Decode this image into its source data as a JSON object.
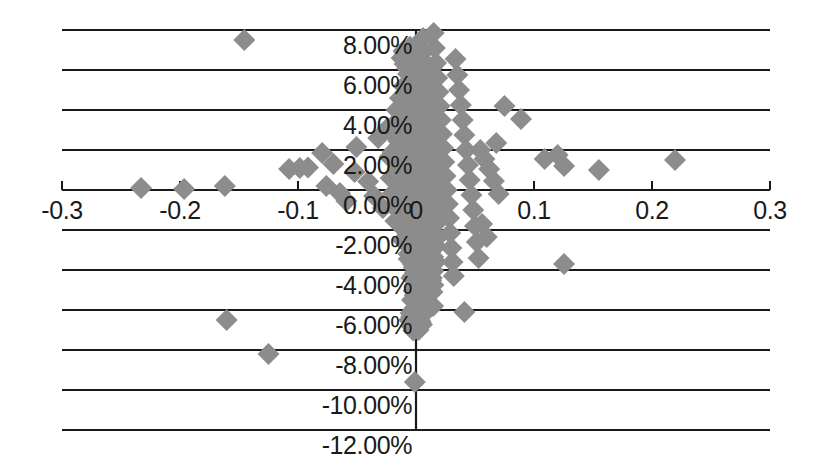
{
  "chart_data": {
    "type": "scatter",
    "title": "",
    "subtitle": "",
    "xlabel": "",
    "ylabel": "",
    "xlim": [
      -0.3,
      0.3
    ],
    "ylim": [
      -0.12,
      0.08
    ],
    "grid": true,
    "grid_axis": "y",
    "legend": null,
    "legend_position": "none",
    "marker": {
      "shape": "diamond",
      "color": "#8c8c8c",
      "size_px": 22,
      "edge": "none"
    },
    "axis_color": "#1a1a1a",
    "background_color": "#ffffff",
    "x_ticks": [
      -0.3,
      -0.2,
      -0.1,
      0,
      0.1,
      0.2,
      0.3
    ],
    "x_tick_labels": [
      "-0.3",
      "-0.2",
      "-0.1",
      "0",
      "0.1",
      "0.2",
      "0.3"
    ],
    "y_ticks": [
      0.08,
      0.06,
      0.04,
      0.02,
      0.0,
      -0.02,
      -0.04,
      -0.06,
      -0.08,
      -0.1,
      -0.12
    ],
    "y_tick_labels": [
      "8.00%",
      "6.00%",
      "4.00%",
      "2.00%",
      "0.00%",
      "-2.00%",
      "-4.00%",
      "-6.00%",
      "-8.00%",
      "-10.00%",
      "-12.00%"
    ],
    "series": [
      {
        "name": "observations",
        "points": [
          [
            -0.1455,
            0.075
          ],
          [
            -0.233,
            0.001
          ],
          [
            -0.1965,
            0.0005
          ],
          [
            -0.162,
            0.002
          ],
          [
            -0.1075,
            0.0105
          ],
          [
            -0.0985,
            0.011
          ],
          [
            -0.0915,
            0.0112
          ],
          [
            -0.0795,
            0.0185
          ],
          [
            -0.07,
            0.013
          ],
          [
            -0.076,
            0.002
          ],
          [
            -0.0645,
            -0.0015
          ],
          [
            -0.059,
            -0.0055
          ],
          [
            -0.052,
            0.009
          ],
          [
            -0.0505,
            0.0215
          ],
          [
            -0.032,
            0.026
          ],
          [
            -0.0405,
            0.0042
          ],
          [
            -0.0355,
            -0.003
          ],
          [
            -0.028,
            -0.009
          ],
          [
            -0.024,
            0.031
          ],
          [
            -0.0225,
            0.0165
          ],
          [
            -0.0215,
            0.006
          ],
          [
            -0.0195,
            -0.0015
          ],
          [
            -0.0185,
            -0.0085
          ],
          [
            -0.0175,
            -0.0155
          ],
          [
            -0.0165,
            0.04
          ],
          [
            -0.0155,
            0.033
          ],
          [
            -0.015,
            0.0245
          ],
          [
            -0.0145,
            0.019
          ],
          [
            -0.014,
            0.012
          ],
          [
            -0.0135,
            0.005
          ],
          [
            -0.013,
            -0.0025
          ],
          [
            -0.0125,
            -0.0095
          ],
          [
            -0.012,
            -0.0175
          ],
          [
            -0.0115,
            -0.025
          ],
          [
            -0.011,
            0.0455
          ],
          [
            -0.0105,
            0.0385
          ],
          [
            -0.01,
            0.03
          ],
          [
            -0.0098,
            0.0225
          ],
          [
            -0.0095,
            0.0155
          ],
          [
            -0.009,
            0.0085
          ],
          [
            -0.0085,
            0.0015
          ],
          [
            -0.008,
            -0.006
          ],
          [
            -0.0075,
            -0.013
          ],
          [
            -0.007,
            -0.0205
          ],
          [
            -0.0065,
            -0.028
          ],
          [
            -0.0062,
            -0.0345
          ],
          [
            -0.006,
            0.052
          ],
          [
            -0.0058,
            0.044
          ],
          [
            -0.0055,
            0.036
          ],
          [
            -0.0052,
            0.0285
          ],
          [
            -0.005,
            0.021
          ],
          [
            -0.0048,
            0.014
          ],
          [
            -0.0045,
            0.007
          ],
          [
            -0.0042,
            0.0
          ],
          [
            -0.004,
            -0.007
          ],
          [
            -0.0038,
            -0.0145
          ],
          [
            -0.0035,
            -0.0215
          ],
          [
            -0.0032,
            -0.029
          ],
          [
            -0.003,
            -0.036
          ],
          [
            -0.0028,
            -0.043
          ],
          [
            -0.0025,
            0.06
          ],
          [
            -0.0022,
            0.0515
          ],
          [
            -0.002,
            0.043
          ],
          [
            -0.0018,
            0.035
          ],
          [
            -0.0015,
            0.0275
          ],
          [
            -0.0012,
            0.02
          ],
          [
            -0.001,
            0.0125
          ],
          [
            -0.0008,
            0.0055
          ],
          [
            -0.0005,
            -0.0015
          ],
          [
            -0.0002,
            -0.0085
          ],
          [
            0.0,
            -0.0155
          ],
          [
            0.0002,
            -0.0225
          ],
          [
            0.0005,
            -0.03
          ],
          [
            0.0008,
            -0.0375
          ],
          [
            0.001,
            -0.045
          ],
          [
            0.0012,
            -0.052
          ],
          [
            0.0015,
            0.068
          ],
          [
            0.0018,
            0.0605
          ],
          [
            0.002,
            0.053
          ],
          [
            0.0022,
            0.0455
          ],
          [
            0.0025,
            0.038
          ],
          [
            0.0028,
            0.0305
          ],
          [
            0.003,
            0.0235
          ],
          [
            0.0032,
            0.0165
          ],
          [
            0.0035,
            0.0095
          ],
          [
            0.0038,
            0.0025
          ],
          [
            0.004,
            -0.0045
          ],
          [
            0.0042,
            -0.0115
          ],
          [
            0.0045,
            -0.0185
          ],
          [
            0.0048,
            -0.0255
          ],
          [
            0.005,
            -0.0325
          ],
          [
            0.0052,
            -0.0395
          ],
          [
            0.0055,
            -0.0465
          ],
          [
            0.0058,
            -0.0535
          ],
          [
            0.006,
            0.076
          ],
          [
            0.0062,
            0.069
          ],
          [
            0.0065,
            0.0615
          ],
          [
            0.0068,
            0.0545
          ],
          [
            0.007,
            0.047
          ],
          [
            0.0075,
            0.04
          ],
          [
            0.008,
            0.033
          ],
          [
            0.0085,
            0.026
          ],
          [
            0.009,
            0.019
          ],
          [
            0.0095,
            0.012
          ],
          [
            0.01,
            0.005
          ],
          [
            0.0105,
            -0.002
          ],
          [
            0.011,
            -0.009
          ],
          [
            0.0115,
            -0.016
          ],
          [
            0.012,
            -0.023
          ],
          [
            0.0125,
            -0.03
          ],
          [
            0.013,
            -0.037
          ],
          [
            0.0135,
            -0.044
          ],
          [
            0.014,
            -0.051
          ],
          [
            0.0145,
            -0.058
          ],
          [
            0.015,
            0.0785
          ],
          [
            0.016,
            0.071
          ],
          [
            0.017,
            0.0635
          ],
          [
            0.018,
            0.056
          ],
          [
            0.019,
            0.049
          ],
          [
            0.02,
            0.042
          ],
          [
            0.021,
            0.035
          ],
          [
            0.022,
            0.028
          ],
          [
            0.023,
            0.021
          ],
          [
            0.024,
            0.014
          ],
          [
            0.025,
            0.007
          ],
          [
            0.026,
            0.0
          ],
          [
            0.027,
            -0.007
          ],
          [
            0.028,
            -0.014
          ],
          [
            0.029,
            -0.0215
          ],
          [
            0.03,
            -0.029
          ],
          [
            0.031,
            -0.036
          ],
          [
            0.032,
            -0.043
          ],
          [
            0.0335,
            0.0655
          ],
          [
            0.035,
            0.0575
          ],
          [
            0.0365,
            0.05
          ],
          [
            0.038,
            0.0425
          ],
          [
            0.0395,
            0.035
          ],
          [
            0.041,
            0.0275
          ],
          [
            0.0425,
            0.02
          ],
          [
            0.044,
            0.0125
          ],
          [
            0.0455,
            0.005
          ],
          [
            0.047,
            -0.0025
          ],
          [
            0.0485,
            -0.01
          ],
          [
            0.05,
            -0.018
          ],
          [
            0.0515,
            -0.026
          ],
          [
            0.053,
            -0.034
          ],
          [
            0.041,
            -0.061
          ],
          [
            0.0545,
            0.02
          ],
          [
            0.058,
            0.0155
          ],
          [
            0.062,
            0.0105
          ],
          [
            0.066,
            0.0045
          ],
          [
            0.07,
            -0.002
          ],
          [
            0.056,
            -0.017
          ],
          [
            0.06,
            -0.0235
          ],
          [
            0.075,
            0.042
          ],
          [
            0.089,
            0.0355
          ],
          [
            0.068,
            0.0235
          ],
          [
            0.109,
            0.0155
          ],
          [
            0.12,
            0.0175
          ],
          [
            0.1255,
            0.012
          ],
          [
            0.1255,
            -0.037
          ],
          [
            0.155,
            0.01
          ],
          [
            0.2195,
            0.015
          ],
          [
            -0.1605,
            -0.065
          ],
          [
            -0.125,
            -0.082
          ],
          [
            -0.001,
            -0.096
          ]
        ]
      }
    ],
    "cluster_blobs": [
      {
        "cx": -0.004,
        "cy": 0.066,
        "rx": 0.01,
        "ry": 0.006
      },
      {
        "cx": 0.004,
        "cy": 0.058,
        "rx": 0.013,
        "ry": 0.008
      },
      {
        "cx": 0.002,
        "cy": 0.046,
        "rx": 0.019,
        "ry": 0.01
      },
      {
        "cx": 0.0,
        "cy": 0.033,
        "rx": 0.022,
        "ry": 0.012
      },
      {
        "cx": 0.0,
        "cy": 0.019,
        "rx": 0.024,
        "ry": 0.012
      },
      {
        "cx": 0.001,
        "cy": 0.005,
        "rx": 0.024,
        "ry": 0.012
      },
      {
        "cx": 0.003,
        "cy": -0.008,
        "rx": 0.022,
        "ry": 0.011
      },
      {
        "cx": 0.005,
        "cy": -0.02,
        "rx": 0.018,
        "ry": 0.01
      },
      {
        "cx": 0.006,
        "cy": -0.032,
        "rx": 0.015,
        "ry": 0.01
      },
      {
        "cx": 0.006,
        "cy": -0.044,
        "rx": 0.012,
        "ry": 0.009
      },
      {
        "cx": 0.004,
        "cy": -0.055,
        "rx": 0.009,
        "ry": 0.008
      },
      {
        "cx": 0.0,
        "cy": -0.065,
        "rx": 0.007,
        "ry": 0.006
      }
    ]
  }
}
